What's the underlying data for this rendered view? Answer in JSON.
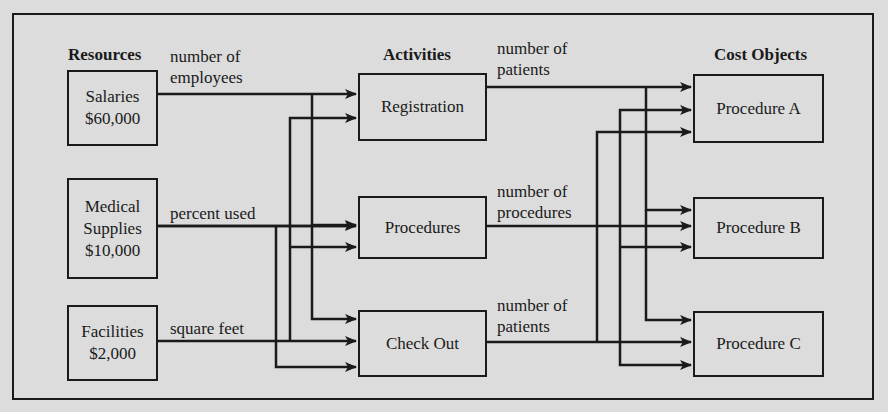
{
  "diagram": {
    "type": "activity-based-costing-flow",
    "columns": {
      "resources": {
        "heading": "Resources",
        "items": [
          {
            "name": "Salaries",
            "amount": "$60,000",
            "driver": [
              "number of",
              "employees"
            ]
          },
          {
            "name": "Medical",
            "name2": "Supplies",
            "amount": "$10,000",
            "driver": [
              "percent used"
            ]
          },
          {
            "name": "Facilities",
            "amount": "$2,000",
            "driver": [
              "square feet"
            ]
          }
        ]
      },
      "activities": {
        "heading": "Activities",
        "items": [
          {
            "name": "Registration",
            "driver": [
              "number of",
              "patients"
            ]
          },
          {
            "name": "Procedures",
            "driver": [
              "number of",
              "procedures"
            ]
          },
          {
            "name": "Check Out",
            "driver": [
              "number of",
              "patients"
            ]
          }
        ]
      },
      "cost_objects": {
        "heading": "Cost Objects",
        "items": [
          {
            "name": "Procedure A"
          },
          {
            "name": "Procedure B"
          },
          {
            "name": "Procedure C"
          }
        ]
      }
    },
    "colors": {
      "background": "#dcdcdc",
      "line": "#1a1a1a"
    },
    "edges": [
      {
        "from": "Salaries",
        "to": [
          "Registration",
          "Procedures",
          "Check Out"
        ]
      },
      {
        "from": "Medical Supplies",
        "to": [
          "Registration",
          "Procedures",
          "Check Out"
        ]
      },
      {
        "from": "Facilities",
        "to": [
          "Registration",
          "Procedures",
          "Check Out"
        ]
      },
      {
        "from": "Registration",
        "to": [
          "Procedure A",
          "Procedure B",
          "Procedure C"
        ]
      },
      {
        "from": "Procedures",
        "to": [
          "Procedure A",
          "Procedure B",
          "Procedure C"
        ]
      },
      {
        "from": "Check Out",
        "to": [
          "Procedure A",
          "Procedure B",
          "Procedure C"
        ]
      }
    ]
  }
}
